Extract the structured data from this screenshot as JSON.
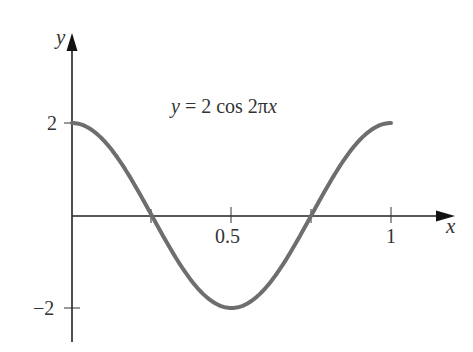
{
  "chart_data": {
    "type": "line",
    "title": "",
    "annotation": "y = 2 cos 2πx",
    "xlabel": "x",
    "ylabel": "y",
    "xlim": [
      0,
      1.15
    ],
    "ylim": [
      -2.4,
      3.0
    ],
    "x_ticks": [
      0.25,
      0.5,
      0.75,
      1
    ],
    "x_tick_labels": [
      "",
      "0.5",
      "",
      "1"
    ],
    "y_ticks": [
      2,
      -2
    ],
    "y_tick_labels": [
      "2",
      "−2"
    ],
    "grid": false,
    "legend": "none",
    "series": [
      {
        "name": "y = 2 cos 2πx",
        "x": [
          0,
          0.125,
          0.25,
          0.375,
          0.5,
          0.625,
          0.75,
          0.875,
          1
        ],
        "y": [
          2,
          1.414,
          0,
          -1.414,
          -2,
          -1.414,
          0,
          1.414,
          2
        ],
        "color": "#6e6e6e"
      }
    ]
  },
  "labels": {
    "equation_lhs": "y",
    "equation_rhs": " = 2 cos 2π",
    "equation_var": "x",
    "x_axis": "x",
    "y_axis": "y",
    "tick_half": "0.5",
    "tick_one": "1",
    "tick_two": "2",
    "tick_neg_two": "−2"
  }
}
